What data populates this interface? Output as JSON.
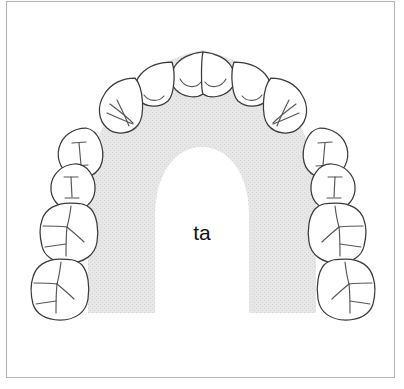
{
  "figure": {
    "title": "ta",
    "center_label": "ta",
    "view": "occlusal",
    "arch": "maxillary",
    "tooth_count": 16,
    "colors": {
      "background": "#ffffff",
      "frame_stroke": "#b4b4b4",
      "tooth_fill": "#ffffff",
      "tooth_stroke": "#3a3a3a",
      "groove_stroke": "#555555",
      "palate_shade": "#e4e4e4",
      "label_text": "#111111"
    },
    "frame": {
      "x": 6,
      "y": 1,
      "width": 389,
      "height": 377
    },
    "palate": {
      "name": "palate-shaded-band",
      "fill_label": "light-gray-halftone",
      "bottom_y": 313
    },
    "teeth": [
      {
        "id": "UR8",
        "name": "upper-right-third-molar",
        "type": "molar",
        "side": "right",
        "groove": "y-fissure",
        "cx": 60,
        "cy": 287
      },
      {
        "id": "UR7",
        "name": "upper-right-second-molar",
        "type": "molar",
        "side": "right",
        "groove": "y-fissure",
        "cx": 72,
        "cy": 232
      },
      {
        "id": "UR6",
        "name": "upper-right-first-molar",
        "type": "premolar",
        "side": "right",
        "groove": "i-groove",
        "cx": 73,
        "cy": 182
      },
      {
        "id": "UR5",
        "name": "upper-right-second-premolar",
        "type": "premolar",
        "side": "right",
        "groove": "i-groove",
        "cx": 84,
        "cy": 152
      },
      {
        "id": "UR4",
        "name": "upper-right-first-premolar",
        "type": "canine",
        "side": "right",
        "groove": "fan",
        "cx": 110,
        "cy": 112
      },
      {
        "id": "UR3",
        "name": "upper-right-canine",
        "type": "incisor-lateral",
        "side": "right",
        "groove": "cingulum-hook",
        "cx": 134,
        "cy": 82
      },
      {
        "id": "UR2",
        "name": "upper-right-lateral-incisor",
        "type": "incisor-central",
        "side": "right",
        "groove": "cingulum-curve",
        "cx": 173,
        "cy": 70
      },
      {
        "id": "UR1",
        "name": "upper-right-central-incisor",
        "type": "incisor-central",
        "side": "right",
        "groove": "cingulum-curve",
        "cx": 202,
        "cy": 68
      },
      {
        "id": "UL1",
        "name": "upper-left-central-incisor",
        "type": "incisor-central",
        "side": "left",
        "groove": "cingulum-curve",
        "cx": 231,
        "cy": 70
      },
      {
        "id": "UL2",
        "name": "upper-left-lateral-incisor",
        "type": "incisor-lateral",
        "side": "left",
        "groove": "cingulum-hook",
        "cx": 267,
        "cy": 82
      },
      {
        "id": "UL3",
        "name": "upper-left-canine",
        "type": "canine",
        "side": "left",
        "groove": "fan",
        "cx": 294,
        "cy": 112
      },
      {
        "id": "UL4",
        "name": "upper-left-first-premolar",
        "type": "premolar",
        "side": "left",
        "groove": "i-groove",
        "cx": 317,
        "cy": 152
      },
      {
        "id": "UL5",
        "name": "upper-left-second-premolar",
        "type": "premolar",
        "side": "left",
        "groove": "i-groove",
        "cx": 328,
        "cy": 182
      },
      {
        "id": "UL6",
        "name": "upper-left-first-molar",
        "type": "molar",
        "side": "left",
        "groove": "y-fissure",
        "cx": 332,
        "cy": 232
      },
      {
        "id": "UL7",
        "name": "upper-left-second-molar",
        "type": "molar",
        "side": "left",
        "groove": "y-fissure",
        "cx": 344,
        "cy": 287
      },
      {
        "id": "UL8",
        "name": "upper-left-third-molar",
        "type": "molar",
        "side": "left",
        "groove": "y-fissure",
        "cx": 344,
        "cy": 287
      }
    ]
  }
}
